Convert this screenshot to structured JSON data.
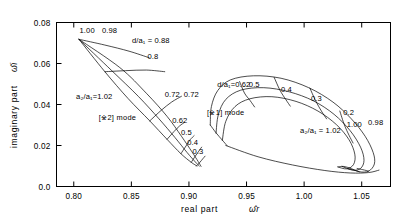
{
  "chart_data": {
    "type": "line",
    "title": "",
    "xlabel": "real part ω̂r",
    "ylabel": "imaginary part ω̂i",
    "xlim": [
      0.785,
      1.075
    ],
    "ylim": [
      0.0,
      0.08
    ],
    "grid": false,
    "legend_position": "none",
    "xticks": [
      "0.80",
      "0.85",
      "0.90",
      "0.95",
      "1.00",
      "1.05"
    ],
    "xtick_values": [
      0.8,
      0.85,
      0.9,
      0.95,
      1.0,
      1.05
    ],
    "yticks": [
      "0.0",
      "0.02",
      "0.04",
      "0.06",
      "0.08"
    ],
    "ytick_values": [
      0.0,
      0.02,
      0.04,
      0.06,
      0.08
    ],
    "mode_labels": [
      {
        "text": "[※2] mode",
        "x": 0.838,
        "y": 0.0325
      },
      {
        "text": "[※1] mode",
        "x": 0.932,
        "y": 0.035
      }
    ],
    "annotations": [
      {
        "text": "1.00",
        "x": 0.805,
        "y": 0.0748
      },
      {
        "text": "0.98",
        "x": 0.8245,
        "y": 0.0748
      },
      {
        "text": "d/a₁ = 0.88",
        "x": 0.8505,
        "y": 0.07
      },
      {
        "text": "0.8",
        "x": 0.864,
        "y": 0.062
      },
      {
        "text": "a₂/a₁=1.02",
        "x": 0.802,
        "y": 0.0428
      },
      {
        "text": "0.72",
        "x": 0.879,
        "y": 0.0438
      },
      {
        "text": "0.72",
        "x": 0.8955,
        "y": 0.0438
      },
      {
        "text": "0.62",
        "x": 0.8855,
        "y": 0.0308
      },
      {
        "text": "0.5",
        "x": 0.893,
        "y": 0.0252
      },
      {
        "text": "0.4",
        "x": 0.8985,
        "y": 0.0202
      },
      {
        "text": "0.3",
        "x": 0.903,
        "y": 0.0158
      },
      {
        "text": "d/a₁=0.62",
        "x": 0.9245,
        "y": 0.0487
      },
      {
        "text": "0.5",
        "x": 0.952,
        "y": 0.0487
      },
      {
        "text": "0.4",
        "x": 0.98,
        "y": 0.0462
      },
      {
        "text": "0.3",
        "x": 1.006,
        "y": 0.0418
      },
      {
        "text": "0.2",
        "x": 1.034,
        "y": 0.0348
      },
      {
        "text": "1.00",
        "x": 1.037,
        "y": 0.0288
      },
      {
        "text": "0.98",
        "x": 1.0555,
        "y": 0.0302
      },
      {
        "text": "a₂/a₁ = 1.02",
        "x": 0.9965,
        "y": 0.0262
      }
    ],
    "series": [
      {
        "name": "mode2-a2a1-1.02",
        "points": [
          [
            0.8045,
            0.0718
          ],
          [
            0.827,
            0.056
          ],
          [
            0.847,
            0.043
          ],
          [
            0.866,
            0.032
          ],
          [
            0.881,
            0.023
          ],
          [
            0.893,
            0.016
          ],
          [
            0.902,
            0.0118
          ],
          [
            0.907,
            0.01
          ]
        ]
      },
      {
        "name": "mode2-a2a1-1.00",
        "points": [
          [
            0.8045,
            0.0718
          ],
          [
            0.833,
            0.0565
          ],
          [
            0.856,
            0.044
          ],
          [
            0.874,
            0.033
          ],
          [
            0.888,
            0.0238
          ],
          [
            0.8985,
            0.0165
          ],
          [
            0.9055,
            0.012
          ],
          [
            0.909,
            0.01
          ]
        ]
      },
      {
        "name": "mode2-a2a1-0.98",
        "points": [
          [
            0.8045,
            0.0718
          ],
          [
            0.84,
            0.058
          ],
          [
            0.863,
            0.0455
          ],
          [
            0.881,
            0.0342
          ],
          [
            0.8935,
            0.0245
          ],
          [
            0.9025,
            0.017
          ],
          [
            0.908,
            0.0122
          ],
          [
            0.9105,
            0.0098
          ]
        ]
      },
      {
        "name": "mode2-d-0.88",
        "points": [
          [
            0.8045,
            0.0718
          ],
          [
            0.827,
            0.069
          ],
          [
            0.848,
            0.066
          ],
          [
            0.8655,
            0.0628
          ]
        ]
      },
      {
        "name": "mode2-d-0.80",
        "points": [
          [
            0.827,
            0.056
          ],
          [
            0.845,
            0.0565
          ],
          [
            0.863,
            0.0568
          ],
          [
            0.879,
            0.056
          ]
        ]
      },
      {
        "name": "mode2-d-0.72",
        "points": [
          [
            0.866,
            0.032
          ],
          [
            0.876,
            0.0372
          ],
          [
            0.885,
            0.0412
          ],
          [
            0.8935,
            0.044
          ]
        ]
      },
      {
        "name": "mode2-d-0.62",
        "points": [
          [
            0.881,
            0.023
          ],
          [
            0.887,
            0.0268
          ],
          [
            0.892,
            0.0296
          ],
          [
            0.896,
            0.0312
          ]
        ]
      },
      {
        "name": "mode2-d-0.50",
        "points": [
          [
            0.893,
            0.016
          ],
          [
            0.8975,
            0.0198
          ],
          [
            0.901,
            0.0228
          ],
          [
            0.9045,
            0.0248
          ]
        ]
      },
      {
        "name": "mode2-d-0.40",
        "points": [
          [
            0.902,
            0.0118
          ],
          [
            0.9055,
            0.0148
          ],
          [
            0.9085,
            0.0172
          ],
          [
            0.911,
            0.0192
          ]
        ]
      },
      {
        "name": "mode2-d-0.30",
        "points": [
          [
            0.9065,
            0.01
          ],
          [
            0.9095,
            0.0118
          ],
          [
            0.912,
            0.0135
          ],
          [
            0.914,
            0.0148
          ]
        ]
      },
      {
        "name": "mode1-outer",
        "points": [
          [
            0.9185,
            0.03
          ],
          [
            0.9195,
            0.039
          ],
          [
            0.925,
            0.0468
          ],
          [
            0.936,
            0.052
          ],
          [
            0.956,
            0.054
          ],
          [
            0.98,
            0.0528
          ],
          [
            1.004,
            0.0482
          ],
          [
            1.025,
            0.0412
          ],
          [
            1.041,
            0.033
          ],
          [
            1.053,
            0.0245
          ],
          [
            1.06,
            0.0165
          ],
          [
            1.061,
            0.011
          ],
          [
            1.056,
            0.0075
          ],
          [
            1.048,
            0.0072
          ],
          [
            1.04,
            0.009
          ]
        ]
      },
      {
        "name": "mode1-inner",
        "points": [
          [
            0.9235,
            0.026
          ],
          [
            0.9255,
            0.035
          ],
          [
            0.932,
            0.0425
          ],
          [
            0.945,
            0.047
          ],
          [
            0.965,
            0.0482
          ],
          [
            0.987,
            0.0462
          ],
          [
            1.008,
            0.0418
          ],
          [
            1.026,
            0.0352
          ],
          [
            1.04,
            0.0272
          ],
          [
            1.049,
            0.0192
          ],
          [
            1.052,
            0.0128
          ],
          [
            1.049,
            0.0088
          ],
          [
            1.042,
            0.008
          ],
          [
            1.033,
            0.0098
          ]
        ]
      },
      {
        "name": "mode1-inner2",
        "points": [
          [
            0.929,
            0.0225
          ],
          [
            0.932,
            0.0318
          ],
          [
            0.94,
            0.039
          ],
          [
            0.953,
            0.0428
          ],
          [
            0.972,
            0.0438
          ],
          [
            0.993,
            0.0415
          ],
          [
            1.012,
            0.0368
          ],
          [
            1.028,
            0.0302
          ],
          [
            1.039,
            0.0228
          ],
          [
            1.044,
            0.0158
          ],
          [
            1.043,
            0.0108
          ],
          [
            1.037,
            0.0086
          ],
          [
            1.029,
            0.0096
          ]
        ]
      },
      {
        "name": "mode1-lower-tail",
        "points": [
          [
            0.932,
            0.02
          ],
          [
            0.96,
            0.0145
          ],
          [
            0.99,
            0.0105
          ],
          [
            1.018,
            0.0078
          ],
          [
            1.04,
            0.0066
          ],
          [
            1.056,
            0.0068
          ],
          [
            1.065,
            0.008
          ]
        ]
      },
      {
        "name": "mode1-rib-0.62",
        "points": [
          [
            0.9185,
            0.03
          ],
          [
            0.9235,
            0.0262
          ],
          [
            0.929,
            0.0226
          ],
          [
            0.933,
            0.02
          ]
        ]
      },
      {
        "name": "mode1-rib-0.50",
        "points": [
          [
            0.944,
            0.0512
          ],
          [
            0.9482,
            0.0456
          ],
          [
            0.953,
            0.042
          ],
          [
            0.957,
            0.0388
          ]
        ]
      },
      {
        "name": "mode1-rib-0.40",
        "points": [
          [
            0.974,
            0.0532
          ],
          [
            0.979,
            0.047
          ],
          [
            0.984,
            0.0425
          ],
          [
            0.988,
            0.0392
          ]
        ]
      },
      {
        "name": "mode1-rib-0.30",
        "points": [
          [
            1.005,
            0.048
          ],
          [
            1.01,
            0.0418
          ],
          [
            1.015,
            0.0368
          ],
          [
            1.0195,
            0.033
          ]
        ]
      },
      {
        "name": "mode1-rib-0.20",
        "points": [
          [
            1.031,
            0.0368
          ],
          [
            1.035,
            0.03
          ],
          [
            1.039,
            0.025
          ],
          [
            1.0425,
            0.0212
          ]
        ]
      },
      {
        "name": "mode1-end-1.02",
        "points": [
          [
            1.04,
            0.009
          ],
          [
            1.034,
            0.0098
          ],
          [
            1.03,
            0.0096
          ]
        ]
      },
      {
        "name": "mode1-end-1.00",
        "points": [
          [
            1.048,
            0.0072
          ],
          [
            1.043,
            0.008
          ],
          [
            1.038,
            0.0086
          ]
        ]
      },
      {
        "name": "mode1-end-0.98",
        "points": [
          [
            1.056,
            0.0075
          ],
          [
            1.051,
            0.0082
          ],
          [
            1.046,
            0.0088
          ]
        ]
      }
    ]
  },
  "axes": {
    "ylabel_line": "imaginary part",
    "ylabel_sym": "ω̂i",
    "xlabel_line": "real part",
    "xlabel_sym": "ω̂r"
  },
  "colors": {
    "ink": "#000000",
    "background": "#ffffff"
  }
}
